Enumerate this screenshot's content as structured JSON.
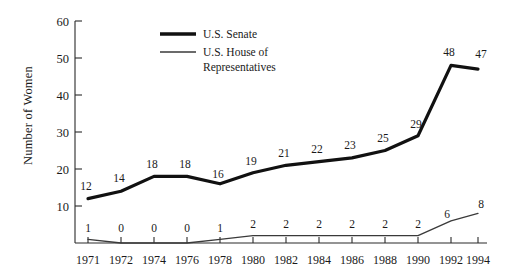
{
  "chart_data": {
    "type": "line",
    "title": "",
    "xlabel": "",
    "ylabel": "Number of Women",
    "x": [
      "1971",
      "1972",
      "1974",
      "1976",
      "1978",
      "1980",
      "1982",
      "1984",
      "1986",
      "1988",
      "1990",
      "1992",
      "1994"
    ],
    "categories": [
      "1971",
      "1972",
      "1974",
      "1976",
      "1978",
      "1980",
      "1982",
      "1984",
      "1986",
      "1988",
      "1990",
      "1992",
      "1994"
    ],
    "series": [
      {
        "name": "U.S. Senate",
        "style": "thick",
        "color": "#111111",
        "values": [
          12,
          14,
          18,
          18,
          16,
          19,
          21,
          22,
          23,
          25,
          29,
          48,
          47
        ]
      },
      {
        "name": "U.S. House of Representatives",
        "style": "thin",
        "color": "#3a3a3a",
        "values": [
          1,
          0,
          0,
          0,
          1,
          2,
          2,
          2,
          2,
          2,
          2,
          6,
          8
        ]
      }
    ],
    "ylim": [
      0,
      60
    ],
    "yticks": [
      0,
      10,
      20,
      30,
      40,
      50,
      60
    ],
    "ytick_labels": [
      "",
      "10",
      "20",
      "30",
      "40",
      "50",
      "60"
    ],
    "grid": false,
    "legend_position": "top-center"
  },
  "legend": {
    "entries": [
      {
        "label": "U.S. Senate"
      },
      {
        "label": "U.S. House of"
      },
      {
        "label": "Representatives"
      }
    ]
  }
}
